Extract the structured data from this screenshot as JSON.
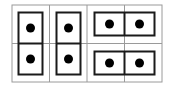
{
  "diagram": {
    "grid": {
      "rows": 2,
      "cols": 4,
      "line_color": "#9a9a9a"
    },
    "dominoes": [
      {
        "orientation": "vertical",
        "cells": [
          [
            0,
            0
          ],
          [
            1,
            0
          ]
        ],
        "pips": [
          1,
          1
        ]
      },
      {
        "orientation": "vertical",
        "cells": [
          [
            0,
            1
          ],
          [
            1,
            1
          ]
        ],
        "pips": [
          1,
          1
        ]
      },
      {
        "orientation": "horizontal",
        "cells": [
          [
            0,
            2
          ],
          [
            0,
            3
          ]
        ],
        "pips": [
          1,
          1
        ]
      },
      {
        "orientation": "horizontal",
        "cells": [
          [
            1,
            2
          ],
          [
            1,
            3
          ]
        ],
        "pips": [
          1,
          1
        ]
      }
    ],
    "colors": {
      "domino_border": "#1a1a1a",
      "pip": "#000000",
      "background": "#ffffff"
    }
  }
}
